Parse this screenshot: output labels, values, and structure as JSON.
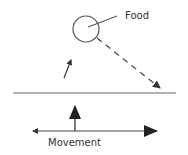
{
  "diagram": {
    "labels": {
      "food": "Food",
      "movement": "Movement"
    },
    "colors": {
      "stroke": "#333333",
      "background": "#ffffff"
    },
    "elements": {
      "food_circle": {
        "cx": 86,
        "cy": 29,
        "r": 13
      },
      "food_leader_line": {
        "x1": 88,
        "y1": 27,
        "x2": 115,
        "y2": 17
      },
      "dashed_trajectory": {
        "x1": 97,
        "y1": 38,
        "x2": 160,
        "y2": 88,
        "style": "dashed",
        "arrowhead": "end"
      },
      "small_arrow": {
        "x1": 64,
        "y1": 78,
        "x2": 71,
        "y2": 60,
        "arrowhead": "end"
      },
      "surface_line": {
        "x1": 13,
        "y1": 93,
        "x2": 176,
        "y2": 93
      },
      "vertical_arrow": {
        "x1": 75,
        "y1": 131,
        "x2": 75,
        "y2": 106,
        "arrowhead": "end"
      },
      "movement_axis": {
        "x1": 33,
        "y1": 131,
        "x2": 157,
        "y2": 131,
        "arrowheads": [
          "start-small",
          "end-large"
        ]
      }
    }
  }
}
